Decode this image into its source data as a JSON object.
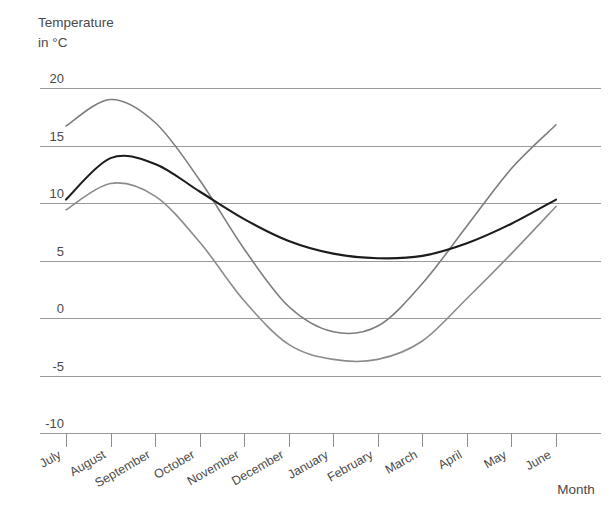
{
  "chart_data": {
    "type": "line",
    "title": "",
    "ylabel": "Temperature in °C",
    "ylabel_line1": "Temperature",
    "ylabel_line2": "in °C",
    "xlabel": "Month",
    "grid": true,
    "legend": "none",
    "ylim": [
      -10,
      20
    ],
    "yticks": [
      20,
      15,
      10,
      5,
      0,
      -5,
      -10
    ],
    "ytick_labels": [
      "20",
      "15",
      "10",
      "5",
      "0",
      "-5",
      "-10"
    ],
    "categories": [
      "July",
      "August",
      "September",
      "October",
      "November",
      "December",
      "January",
      "February",
      "March",
      "April",
      "May",
      "June"
    ],
    "series": [
      {
        "name": "maximum-temperature",
        "color": "#7d7d7d",
        "width": 1.6,
        "values": [
          16.7,
          19.0,
          17.0,
          12.0,
          6.0,
          1.0,
          -1.2,
          -0.7,
          3.0,
          8.0,
          13.0,
          16.8
        ]
      },
      {
        "name": "mean-temperature",
        "color": "#1c1c1c",
        "width": 2.1,
        "values": [
          10.3,
          13.9,
          13.4,
          11.0,
          8.6,
          6.7,
          5.6,
          5.2,
          5.4,
          6.5,
          8.2,
          10.3
        ]
      },
      {
        "name": "minimum-temperature",
        "color": "#8b8b8b",
        "width": 1.6,
        "values": [
          9.4,
          11.7,
          10.6,
          6.6,
          1.5,
          -2.3,
          -3.6,
          -3.6,
          -2.0,
          1.7,
          5.6,
          9.7
        ]
      }
    ]
  },
  "axes": {
    "y_title_line1": "Temperature",
    "y_title_line2": "in °C",
    "x_title": "Month"
  },
  "y_labels": [
    {
      "text": "20"
    },
    {
      "text": "15"
    },
    {
      "text": "10"
    },
    {
      "text": "5"
    },
    {
      "text": "0"
    },
    {
      "text": "-5"
    },
    {
      "text": "-10"
    }
  ],
  "x_labels": [
    {
      "text": "July"
    },
    {
      "text": "August"
    },
    {
      "text": "September"
    },
    {
      "text": "October"
    },
    {
      "text": "November"
    },
    {
      "text": "December"
    },
    {
      "text": "January"
    },
    {
      "text": "February"
    },
    {
      "text": "March"
    },
    {
      "text": "April"
    },
    {
      "text": "May"
    },
    {
      "text": "June"
    }
  ]
}
